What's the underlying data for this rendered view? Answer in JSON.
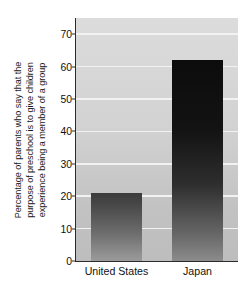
{
  "chart_data": {
    "type": "bar",
    "title": "",
    "subtitle": "",
    "xlabel": "",
    "ylabel_lines": [
      "Percentage of parents who say that the",
      "purpose of preschool is to give children",
      "experience being a member of a group"
    ],
    "ylabel": "Percentage of parents who say that the purpose of preschool is to give children experience being a member of a group",
    "categories": [
      "United States",
      "Japan"
    ],
    "values": [
      21,
      62
    ],
    "ylim": [
      0,
      75
    ],
    "yticks": [
      0,
      10,
      20,
      30,
      40,
      50,
      60,
      70
    ],
    "ytick_labels": [
      "0",
      "10",
      "20",
      "30",
      "40",
      "50",
      "60",
      "70"
    ],
    "grid": true,
    "grid_axis": "y",
    "grid_color": "#f2f2f2",
    "legend": false,
    "legend_position": "none",
    "plot_background": "#d2d2d2",
    "bar_colors": [
      "#6e6e6e",
      "#1a1a1a"
    ],
    "bar_style": "vertical-gradient-dark-to-light",
    "axis_color": "#2b2b2b",
    "text_color": "#111111"
  }
}
